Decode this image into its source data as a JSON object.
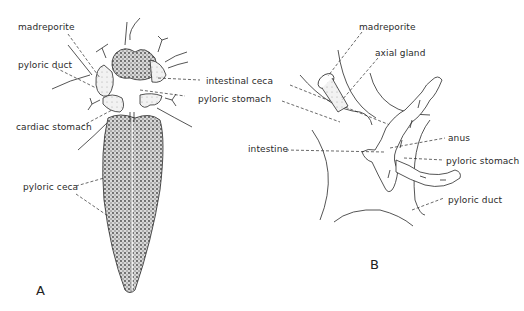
{
  "figure": {
    "panels": [
      {
        "id": "A",
        "letter": "A",
        "labels": {
          "madreporite": "madreporite",
          "pyloric_duct": "pyloric duct",
          "cardiac_stomach": "cardiac stomach",
          "pyloric_ceca": "pyloric ceca",
          "intestinal_ceca": "intestinal ceca",
          "pyloric_stomach": "pyloric stomach"
        }
      },
      {
        "id": "B",
        "letter": "B",
        "labels": {
          "madreporite": "madreporite",
          "axial_gland": "axial gland",
          "intestine": "intestine",
          "anus": "anus",
          "pyloric_stomach": "pyloric stomach",
          "pyloric_duct": "pyloric duct"
        }
      }
    ],
    "colors": {
      "ink": "#2a2a2a",
      "stipple": "#555555",
      "background": "#ffffff"
    }
  }
}
